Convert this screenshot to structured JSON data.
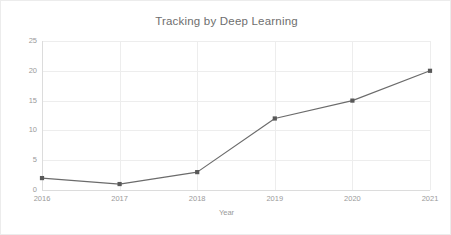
{
  "chart_data": {
    "type": "line",
    "title": "Tracking by Deep Learning",
    "xlabel": "Year",
    "ylabel": "Count",
    "categories": [
      "2016",
      "2017",
      "2018",
      "2019",
      "2020",
      "2021"
    ],
    "values": [
      2,
      1,
      3,
      12,
      15,
      20
    ],
    "series": [
      {
        "name": "Count",
        "values": [
          2,
          1,
          3,
          12,
          15,
          20
        ]
      }
    ],
    "x_tick_labels": [
      "2016",
      "2017",
      "2018",
      "2019",
      "2020",
      "2021"
    ],
    "y_tick_labels": [
      "0",
      "5",
      "10",
      "15",
      "20",
      "25"
    ],
    "y_ticks": [
      0,
      5,
      10,
      15,
      20,
      25
    ],
    "ylim": [
      0,
      25
    ],
    "grid": true,
    "legend": "none",
    "marker": "square",
    "line_color": "#6b6b6b",
    "marker_color": "#595959",
    "grid_color": "#ededed",
    "axis_color": "#dcdcdc",
    "title_color": "#6e6e6e",
    "tick_label_color": "#9a9a9a",
    "background_color": "#ffffff"
  }
}
